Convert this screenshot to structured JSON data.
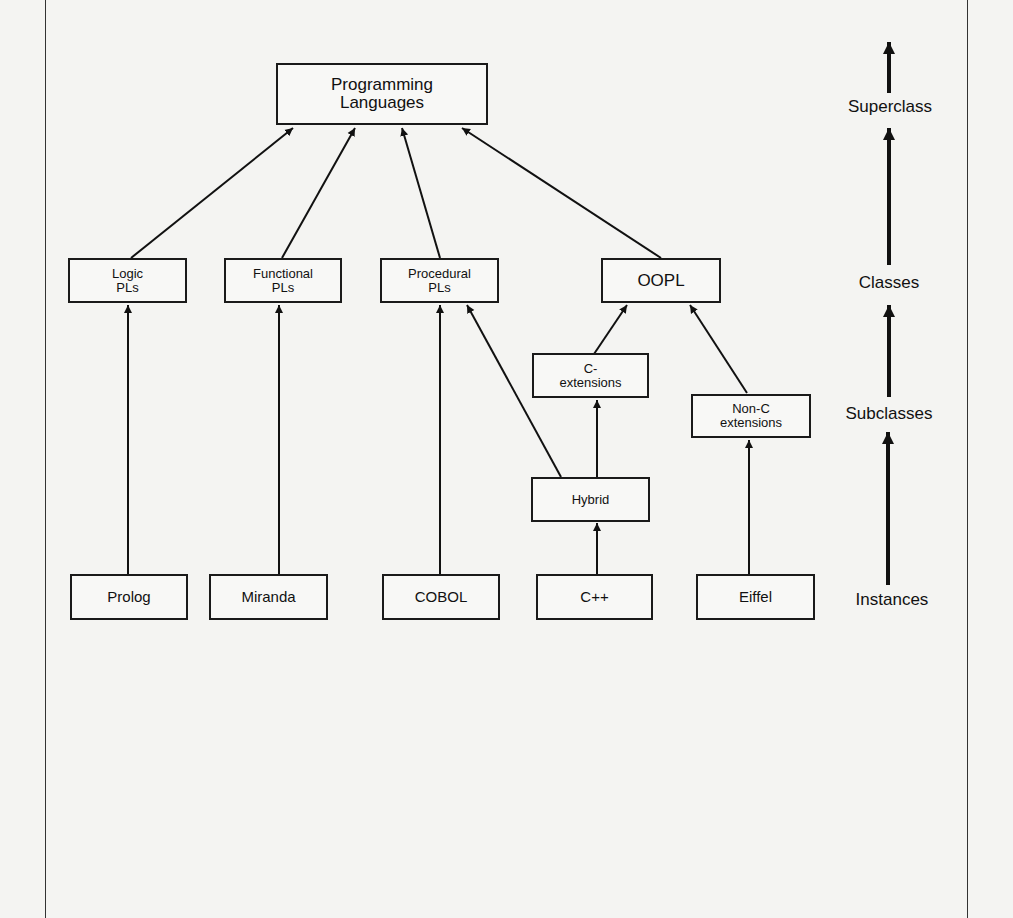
{
  "diagram": {
    "type": "class-hierarchy",
    "nodes": {
      "root": {
        "label": "Programming\nLanguages"
      },
      "logic": {
        "label": "Logic\nPLs"
      },
      "functional": {
        "label": "Functional\nPLs"
      },
      "procedural": {
        "label": "Procedural\nPLs"
      },
      "oopl": {
        "label": "OOPL"
      },
      "c_ext": {
        "label": "C-\nextensions"
      },
      "nonc_ext": {
        "label": "Non-C\nextensions"
      },
      "hybrid": {
        "label": "Hybrid"
      },
      "prolog": {
        "label": "Prolog"
      },
      "miranda": {
        "label": "Miranda"
      },
      "cobol": {
        "label": "COBOL"
      },
      "cpp": {
        "label": "C++"
      },
      "eiffel": {
        "label": "Eiffel"
      }
    },
    "edges": [
      {
        "from": "logic",
        "to": "root"
      },
      {
        "from": "functional",
        "to": "root"
      },
      {
        "from": "procedural",
        "to": "root"
      },
      {
        "from": "oopl",
        "to": "root"
      },
      {
        "from": "prolog",
        "to": "logic"
      },
      {
        "from": "miranda",
        "to": "functional"
      },
      {
        "from": "cobol",
        "to": "procedural"
      },
      {
        "from": "hybrid",
        "to": "procedural"
      },
      {
        "from": "c_ext",
        "to": "oopl"
      },
      {
        "from": "nonc_ext",
        "to": "oopl"
      },
      {
        "from": "hybrid",
        "to": "c_ext"
      },
      {
        "from": "cpp",
        "to": "hybrid"
      },
      {
        "from": "eiffel",
        "to": "nonc_ext"
      }
    ],
    "legend": {
      "levels": [
        "Superclass",
        "Classes",
        "Subclasses",
        "Instances"
      ]
    }
  }
}
